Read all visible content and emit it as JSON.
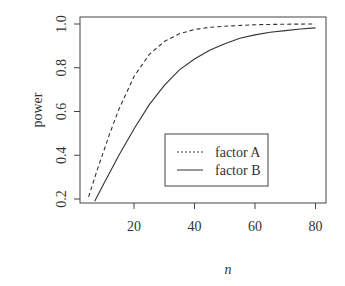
{
  "chart_data": {
    "type": "line",
    "title": "",
    "xlabel": "n",
    "ylabel": "power",
    "xlim": [
      3,
      83
    ],
    "ylim": [
      0.18,
      1.02
    ],
    "xticks": [
      20,
      40,
      60,
      80
    ],
    "yticks": [
      0.2,
      0.4,
      0.6,
      0.8,
      1.0
    ],
    "ytick_labels": [
      "0.2",
      "0.4",
      "0.6",
      "0.8",
      "1.0"
    ],
    "xtick_labels": [
      "20",
      "40",
      "60",
      "80"
    ],
    "grid": false,
    "legend_position": "inside-bottom-center",
    "series": [
      {
        "name": "factor A",
        "style": "dashed",
        "x": [
          5,
          8,
          10,
          12,
          15,
          20,
          25,
          30,
          35,
          40,
          45,
          50,
          60,
          70,
          80
        ],
        "y": [
          0.21,
          0.34,
          0.42,
          0.5,
          0.61,
          0.76,
          0.86,
          0.92,
          0.955,
          0.975,
          0.985,
          0.99,
          0.997,
          0.999,
          1.0
        ]
      },
      {
        "name": "factor B",
        "style": "solid",
        "x": [
          7,
          10,
          15,
          20,
          25,
          30,
          35,
          40,
          45,
          50,
          55,
          60,
          65,
          70,
          75,
          80
        ],
        "y": [
          0.19,
          0.27,
          0.4,
          0.52,
          0.63,
          0.72,
          0.79,
          0.84,
          0.88,
          0.91,
          0.935,
          0.95,
          0.962,
          0.97,
          0.977,
          0.982
        ]
      }
    ]
  }
}
